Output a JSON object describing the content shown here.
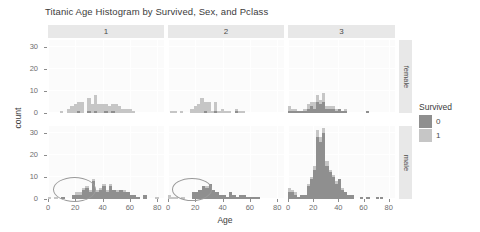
{
  "chart_data": {
    "type": "bar",
    "title": "Titanic Age Histogram by Survived, Sex, and Pclass",
    "xlabel": "Age",
    "ylabel": "count",
    "xlim": [
      0,
      85
    ],
    "ylim": [
      0,
      33
    ],
    "xticks": [
      0,
      20,
      40,
      60,
      80
    ],
    "yticks": [
      0,
      10,
      20,
      30
    ],
    "grid": true,
    "binwidth": 2.5,
    "stacked": true,
    "legend": {
      "title": "Survived",
      "position": "right",
      "entries": [
        {
          "label": "0",
          "color": "#8f8f8f"
        },
        {
          "label": "1",
          "color": "#c6c6c6"
        }
      ]
    },
    "facets": {
      "col_variable": "Pclass",
      "col_labels": [
        "1",
        "2",
        "3"
      ],
      "row_variable": "Sex",
      "row_labels": [
        "female",
        "male"
      ]
    },
    "panels": [
      {
        "row": "female",
        "col": "1",
        "bins": [
          {
            "x": 2.5,
            "v0": 0,
            "v1": 0
          },
          {
            "x": 5.0,
            "v0": 0,
            "v1": 0
          },
          {
            "x": 7.5,
            "v0": 0,
            "v1": 0
          },
          {
            "x": 10.0,
            "v0": 0,
            "v1": 1
          },
          {
            "x": 12.5,
            "v0": 0,
            "v1": 0
          },
          {
            "x": 15.0,
            "v0": 0,
            "v1": 2
          },
          {
            "x": 17.5,
            "v0": 0,
            "v1": 3
          },
          {
            "x": 20.0,
            "v0": 0,
            "v1": 4
          },
          {
            "x": 22.5,
            "v0": 1,
            "v1": 4
          },
          {
            "x": 25.0,
            "v0": 0,
            "v1": 5
          },
          {
            "x": 27.5,
            "v0": 0,
            "v1": 0
          },
          {
            "x": 30.0,
            "v0": 1,
            "v1": 6
          },
          {
            "x": 32.5,
            "v0": 0,
            "v1": 4
          },
          {
            "x": 35.0,
            "v0": 1,
            "v1": 7
          },
          {
            "x": 37.5,
            "v0": 0,
            "v1": 4
          },
          {
            "x": 40.0,
            "v0": 0,
            "v1": 4
          },
          {
            "x": 42.5,
            "v0": 1,
            "v1": 3
          },
          {
            "x": 45.0,
            "v0": 0,
            "v1": 3
          },
          {
            "x": 47.5,
            "v0": 1,
            "v1": 3
          },
          {
            "x": 50.0,
            "v0": 0,
            "v1": 4
          },
          {
            "x": 52.5,
            "v0": 0,
            "v1": 3
          },
          {
            "x": 55.0,
            "v0": 0,
            "v1": 2
          },
          {
            "x": 57.5,
            "v0": 0,
            "v1": 2
          },
          {
            "x": 60.0,
            "v0": 0,
            "v1": 2
          },
          {
            "x": 62.5,
            "v0": 0,
            "v1": 1
          },
          {
            "x": 65.0,
            "v0": 0,
            "v1": 0
          }
        ]
      },
      {
        "row": "female",
        "col": "2",
        "bins": [
          {
            "x": 2.5,
            "v0": 0,
            "v1": 1
          },
          {
            "x": 5.0,
            "v0": 0,
            "v1": 1
          },
          {
            "x": 7.5,
            "v0": 0,
            "v1": 0
          },
          {
            "x": 10.0,
            "v0": 0,
            "v1": 1
          },
          {
            "x": 12.5,
            "v0": 0,
            "v1": 0
          },
          {
            "x": 15.0,
            "v0": 0,
            "v1": 0
          },
          {
            "x": 17.5,
            "v0": 0,
            "v1": 2
          },
          {
            "x": 20.0,
            "v0": 0,
            "v1": 3
          },
          {
            "x": 22.5,
            "v0": 0,
            "v1": 4
          },
          {
            "x": 25.0,
            "v0": 0,
            "v1": 7
          },
          {
            "x": 27.5,
            "v0": 1,
            "v1": 4
          },
          {
            "x": 30.0,
            "v0": 0,
            "v1": 5
          },
          {
            "x": 32.5,
            "v0": 0,
            "v1": 1
          },
          {
            "x": 35.0,
            "v0": 1,
            "v1": 4
          },
          {
            "x": 37.5,
            "v0": 0,
            "v1": 1
          },
          {
            "x": 40.0,
            "v0": 0,
            "v1": 2
          },
          {
            "x": 42.5,
            "v0": 0,
            "v1": 1
          },
          {
            "x": 45.0,
            "v0": 0,
            "v1": 1
          },
          {
            "x": 47.5,
            "v0": 0,
            "v1": 0
          },
          {
            "x": 50.0,
            "v0": 1,
            "v1": 1
          },
          {
            "x": 52.5,
            "v0": 0,
            "v1": 1
          },
          {
            "x": 55.0,
            "v0": 0,
            "v1": 1
          },
          {
            "x": 57.5,
            "v0": 0,
            "v1": 0
          }
        ]
      },
      {
        "row": "female",
        "col": "3",
        "bins": [
          {
            "x": 1.0,
            "v0": 1,
            "v1": 2
          },
          {
            "x": 3.5,
            "v0": 1,
            "v1": 1
          },
          {
            "x": 6.0,
            "v0": 1,
            "v1": 1
          },
          {
            "x": 8.5,
            "v0": 1,
            "v1": 0
          },
          {
            "x": 11.0,
            "v0": 1,
            "v1": 0
          },
          {
            "x": 13.5,
            "v0": 1,
            "v1": 1
          },
          {
            "x": 16.0,
            "v0": 2,
            "v1": 2
          },
          {
            "x": 18.5,
            "v0": 3,
            "v1": 2
          },
          {
            "x": 21.0,
            "v0": 2,
            "v1": 3
          },
          {
            "x": 23.5,
            "v0": 5,
            "v1": 3
          },
          {
            "x": 26.0,
            "v0": 4,
            "v1": 2
          },
          {
            "x": 28.5,
            "v0": 5,
            "v1": 4
          },
          {
            "x": 31.0,
            "v0": 2,
            "v1": 1
          },
          {
            "x": 33.5,
            "v0": 2,
            "v1": 1
          },
          {
            "x": 36.0,
            "v0": 2,
            "v1": 1
          },
          {
            "x": 38.5,
            "v0": 1,
            "v1": 1
          },
          {
            "x": 41.0,
            "v0": 2,
            "v1": 0
          },
          {
            "x": 43.5,
            "v0": 1,
            "v1": 0
          },
          {
            "x": 46.0,
            "v0": 1,
            "v1": 1
          },
          {
            "x": 48.5,
            "v0": 0,
            "v1": 0
          },
          {
            "x": 63.0,
            "v0": 1,
            "v1": 0
          }
        ]
      },
      {
        "row": "male",
        "col": "1",
        "bins": [
          {
            "x": 1.0,
            "v0": 0,
            "v1": 1
          },
          {
            "x": 6.0,
            "v0": 0,
            "v1": 1
          },
          {
            "x": 11.0,
            "v0": 1,
            "v1": 0
          },
          {
            "x": 18.5,
            "v0": 2,
            "v1": 0
          },
          {
            "x": 21.0,
            "v0": 2,
            "v1": 1
          },
          {
            "x": 23.5,
            "v0": 2,
            "v1": 1
          },
          {
            "x": 26.0,
            "v0": 4,
            "v1": 1
          },
          {
            "x": 28.5,
            "v0": 5,
            "v1": 1
          },
          {
            "x": 31.0,
            "v0": 3,
            "v1": 1
          },
          {
            "x": 33.5,
            "v0": 8,
            "v1": 1
          },
          {
            "x": 36.0,
            "v0": 3,
            "v1": 1
          },
          {
            "x": 38.5,
            "v0": 4,
            "v1": 1
          },
          {
            "x": 41.0,
            "v0": 6,
            "v1": 1
          },
          {
            "x": 43.5,
            "v0": 3,
            "v1": 1
          },
          {
            "x": 46.0,
            "v0": 6,
            "v1": 1
          },
          {
            "x": 48.5,
            "v0": 4,
            "v1": 0
          },
          {
            "x": 51.0,
            "v0": 3,
            "v1": 1
          },
          {
            "x": 53.5,
            "v0": 4,
            "v1": 0
          },
          {
            "x": 56.0,
            "v0": 3,
            "v1": 1
          },
          {
            "x": 58.5,
            "v0": 3,
            "v1": 0
          },
          {
            "x": 61.0,
            "v0": 2,
            "v1": 0
          },
          {
            "x": 63.5,
            "v0": 2,
            "v1": 0
          },
          {
            "x": 66.0,
            "v0": 1,
            "v1": 0
          },
          {
            "x": 71.0,
            "v0": 2,
            "v1": 0
          },
          {
            "x": 80.0,
            "v0": 0,
            "v1": 1
          }
        ]
      },
      {
        "row": "male",
        "col": "2",
        "bins": [
          {
            "x": 1.0,
            "v0": 0,
            "v1": 2
          },
          {
            "x": 3.5,
            "v0": 0,
            "v1": 1
          },
          {
            "x": 6.0,
            "v0": 0,
            "v1": 1
          },
          {
            "x": 11.0,
            "v0": 0,
            "v1": 1
          },
          {
            "x": 18.5,
            "v0": 3,
            "v1": 0
          },
          {
            "x": 21.0,
            "v0": 3,
            "v1": 0
          },
          {
            "x": 23.5,
            "v0": 4,
            "v1": 0
          },
          {
            "x": 26.0,
            "v0": 6,
            "v1": 0
          },
          {
            "x": 28.5,
            "v0": 5,
            "v1": 1
          },
          {
            "x": 31.0,
            "v0": 7,
            "v1": 0
          },
          {
            "x": 33.5,
            "v0": 4,
            "v1": 0
          },
          {
            "x": 36.0,
            "v0": 3,
            "v1": 0
          },
          {
            "x": 38.5,
            "v0": 2,
            "v1": 0
          },
          {
            "x": 41.0,
            "v0": 2,
            "v1": 0
          },
          {
            "x": 43.5,
            "v0": 1,
            "v1": 0
          },
          {
            "x": 46.0,
            "v0": 3,
            "v1": 0
          },
          {
            "x": 48.5,
            "v0": 2,
            "v1": 0
          },
          {
            "x": 51.0,
            "v0": 1,
            "v1": 0
          },
          {
            "x": 53.5,
            "v0": 2,
            "v1": 0
          },
          {
            "x": 56.0,
            "v0": 2,
            "v1": 0
          },
          {
            "x": 58.5,
            "v0": 1,
            "v1": 0
          },
          {
            "x": 61.0,
            "v0": 1,
            "v1": 0
          },
          {
            "x": 63.5,
            "v0": 1,
            "v1": 0
          },
          {
            "x": 66.0,
            "v0": 1,
            "v1": 0
          }
        ]
      },
      {
        "row": "male",
        "col": "3",
        "bins": [
          {
            "x": 1.0,
            "v0": 3,
            "v1": 2
          },
          {
            "x": 3.5,
            "v0": 3,
            "v1": 1
          },
          {
            "x": 6.0,
            "v0": 2,
            "v1": 1
          },
          {
            "x": 8.5,
            "v0": 1,
            "v1": 0
          },
          {
            "x": 11.0,
            "v0": 2,
            "v1": 0
          },
          {
            "x": 13.5,
            "v0": 2,
            "v1": 0
          },
          {
            "x": 16.0,
            "v0": 6,
            "v1": 1
          },
          {
            "x": 18.5,
            "v0": 9,
            "v1": 1
          },
          {
            "x": 21.0,
            "v0": 13,
            "v1": 2
          },
          {
            "x": 23.5,
            "v0": 28,
            "v1": 3
          },
          {
            "x": 26.0,
            "v0": 26,
            "v1": 2
          },
          {
            "x": 28.5,
            "v0": 30,
            "v1": 2
          },
          {
            "x": 31.0,
            "v0": 15,
            "v1": 2
          },
          {
            "x": 33.5,
            "v0": 12,
            "v1": 1
          },
          {
            "x": 36.0,
            "v0": 10,
            "v1": 1
          },
          {
            "x": 38.5,
            "v0": 7,
            "v1": 1
          },
          {
            "x": 41.0,
            "v0": 9,
            "v1": 0
          },
          {
            "x": 43.5,
            "v0": 4,
            "v1": 1
          },
          {
            "x": 46.0,
            "v0": 3,
            "v1": 0
          },
          {
            "x": 48.5,
            "v0": 2,
            "v1": 0
          },
          {
            "x": 51.0,
            "v0": 2,
            "v1": 0
          },
          {
            "x": 58.5,
            "v0": 1,
            "v1": 0
          },
          {
            "x": 63.5,
            "v0": 1,
            "v1": 0
          },
          {
            "x": 71.0,
            "v0": 1,
            "v1": 0
          },
          {
            "x": 74.0,
            "v0": 1,
            "v1": 0
          }
        ]
      }
    ],
    "annotations": [
      {
        "shape": "ellipse",
        "panel_row": "male",
        "panel_col": "1",
        "x_range": [
          0,
          20
        ],
        "y_range": [
          0,
          6
        ]
      },
      {
        "shape": "ellipse",
        "panel_row": "male",
        "panel_col": "2",
        "x_range": [
          0,
          18
        ],
        "y_range": [
          0,
          6
        ]
      }
    ]
  }
}
